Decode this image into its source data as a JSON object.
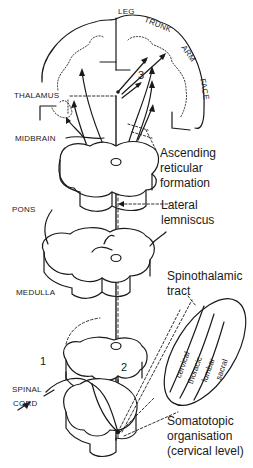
{
  "diagram": {
    "title": "",
    "regions": {
      "cortex_labels": [
        "LEG",
        "TRUNK",
        "ARM",
        "FACE"
      ],
      "left_labels": {
        "thalamus": "THALAMUS",
        "midbrain": "MIDBRAIN",
        "pons": "PONS",
        "medulla": "MEDULLA",
        "spinal_cord_line1": "SPINAL",
        "spinal_cord_line2": "CORD"
      },
      "right_labels": {
        "reticular_line1": "Ascending",
        "reticular_line2": "reticular",
        "reticular_line3": "formation",
        "lemniscus_line1": "Lateral",
        "lemniscus_line2": "lemniscus",
        "tract_line1": "Spinothalamic",
        "tract_line2": "tract",
        "somato_line1": "Somatotopic",
        "somato_line2": "organisation",
        "somato_line3": "(cervical level)"
      },
      "neuron_numbers": [
        "1",
        "2",
        "3"
      ],
      "somatotopic_segments": [
        "cervical",
        "thoracic",
        "lumbar",
        "sacral"
      ]
    },
    "colors": {
      "ink": "#1a1a1a",
      "background": "#ffffff"
    }
  }
}
